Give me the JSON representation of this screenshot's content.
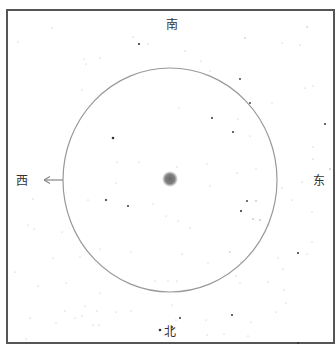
{
  "directions": {
    "south": "南",
    "north": "北",
    "east": "东",
    "west": "西"
  },
  "colors": {
    "background": "#ffffff",
    "frame": "#555555",
    "circle": "#999999",
    "star": "#777777",
    "center_blob": "#777777",
    "arrow": "#888888",
    "label": "#333333"
  },
  "frame": {
    "x": 7,
    "y": 10,
    "width": 327,
    "height": 333
  },
  "circle": {
    "cx": 170,
    "cy": 180,
    "rx": 107,
    "ry": 112
  },
  "center_object": {
    "cx": 170,
    "cy": 179,
    "r": 7
  },
  "west_arrow": {
    "x1": 63,
    "y1": 180,
    "x2": 43,
    "y2": 180
  },
  "stars": [
    [
      52,
      28,
      0.6
    ],
    [
      133,
      37,
      0.6
    ],
    [
      139,
      44,
      1.1
    ],
    [
      148,
      44,
      0.5
    ],
    [
      185,
      51,
      0.6
    ],
    [
      245,
      38,
      0.7
    ],
    [
      307,
      27,
      0.7
    ],
    [
      282,
      43,
      0.5
    ],
    [
      300,
      45,
      0.6
    ],
    [
      18,
      42,
      0.5
    ],
    [
      84,
      59,
      0.5
    ],
    [
      100,
      58,
      0.5
    ],
    [
      86,
      64,
      0.5
    ],
    [
      201,
      61,
      0.5
    ],
    [
      210,
      71,
      0.5
    ],
    [
      240,
      79,
      0.9
    ],
    [
      250,
      103,
      0.9
    ],
    [
      272,
      103,
      0.5
    ],
    [
      305,
      88,
      0.5
    ],
    [
      313,
      86,
      0.5
    ],
    [
      82,
      90,
      0.5
    ],
    [
      179,
      108,
      0.5
    ],
    [
      212,
      118,
      1.0
    ],
    [
      238,
      119,
      0.5
    ],
    [
      325,
      124,
      1.0
    ],
    [
      113,
      138,
      1.3
    ],
    [
      233,
      132,
      1.0
    ],
    [
      250,
      136,
      0.5
    ],
    [
      313,
      147,
      0.5
    ],
    [
      117,
      162,
      0.5
    ],
    [
      139,
      162,
      0.5
    ],
    [
      177,
      167,
      0.5
    ],
    [
      207,
      164,
      0.5
    ],
    [
      237,
      173,
      0.6
    ],
    [
      256,
      169,
      0.5
    ],
    [
      313,
      159,
      0.6
    ],
    [
      330,
      169,
      0.8
    ],
    [
      28,
      180,
      0.5
    ],
    [
      116,
      183,
      0.5
    ],
    [
      210,
      186,
      0.5
    ],
    [
      282,
      188,
      0.5
    ],
    [
      302,
      182,
      0.5
    ],
    [
      106,
      200,
      1.1
    ],
    [
      128,
      206,
      1.0
    ],
    [
      153,
      204,
      0.5
    ],
    [
      247,
      201,
      0.9
    ],
    [
      256,
      201,
      0.8
    ],
    [
      241,
      211,
      1.1
    ],
    [
      253,
      219,
      0.8
    ],
    [
      260,
      220,
      0.8
    ],
    [
      33,
      199,
      0.5
    ],
    [
      88,
      200,
      0.5
    ],
    [
      292,
      200,
      0.5
    ],
    [
      312,
      212,
      0.5
    ],
    [
      28,
      225,
      0.5
    ],
    [
      34,
      229,
      0.5
    ],
    [
      166,
      216,
      0.5
    ],
    [
      178,
      221,
      0.5
    ],
    [
      269,
      225,
      0.5
    ],
    [
      62,
      232,
      0.5
    ],
    [
      190,
      228,
      0.5
    ],
    [
      100,
      249,
      0.5
    ],
    [
      131,
      252,
      0.5
    ],
    [
      182,
      254,
      0.5
    ],
    [
      230,
      252,
      0.7
    ],
    [
      307,
      254,
      0.5
    ],
    [
      312,
      242,
      0.5
    ],
    [
      298,
      253,
      1.0
    ],
    [
      53,
      258,
      0.5
    ],
    [
      80,
      257,
      0.5
    ],
    [
      208,
      263,
      0.5
    ],
    [
      241,
      262,
      0.5
    ],
    [
      278,
      258,
      0.5
    ],
    [
      283,
      269,
      0.5
    ],
    [
      15,
      272,
      0.5
    ],
    [
      236,
      276,
      0.5
    ],
    [
      38,
      286,
      0.5
    ],
    [
      66,
      283,
      0.5
    ],
    [
      100,
      293,
      0.5
    ],
    [
      155,
      281,
      0.5
    ],
    [
      168,
      281,
      0.5
    ],
    [
      177,
      281,
      0.5
    ],
    [
      240,
      283,
      0.5
    ],
    [
      268,
      282,
      0.5
    ],
    [
      284,
      290,
      0.5
    ],
    [
      85,
      306,
      0.5
    ],
    [
      65,
      311,
      0.5
    ],
    [
      75,
      318,
      0.5
    ],
    [
      82,
      316,
      0.5
    ],
    [
      97,
      311,
      0.5
    ],
    [
      116,
      312,
      0.5
    ],
    [
      131,
      311,
      0.5
    ],
    [
      172,
      305,
      0.5
    ],
    [
      180,
      318,
      1.0
    ],
    [
      176,
      320,
      0.5
    ],
    [
      206,
      320,
      0.5
    ],
    [
      232,
      315,
      1.0
    ],
    [
      251,
      322,
      0.5
    ],
    [
      276,
      312,
      0.5
    ],
    [
      286,
      303,
      0.5
    ],
    [
      30,
      318,
      0.5
    ],
    [
      56,
      323,
      0.5
    ],
    [
      93,
      325,
      0.5
    ],
    [
      99,
      325,
      0.5
    ],
    [
      160,
      330,
      1.3
    ],
    [
      172,
      327,
      1.0
    ],
    [
      207,
      335,
      0.5
    ],
    [
      224,
      334,
      0.5
    ],
    [
      248,
      336,
      0.5
    ],
    [
      298,
      343,
      1.0
    ],
    [
      26,
      339,
      0.5
    ]
  ]
}
